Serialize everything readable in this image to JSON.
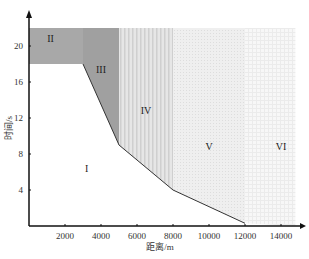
{
  "chart_data": {
    "type": "area",
    "title": "",
    "xlabel": "距离/m",
    "ylabel": "时间/s",
    "xlim": [
      0,
      15500
    ],
    "ylim": [
      0,
      22
    ],
    "x_ticks": [
      2000,
      4000,
      6000,
      8000,
      10000,
      12000,
      14000
    ],
    "y_ticks": [
      4,
      8,
      12,
      16,
      20
    ],
    "grid": false,
    "legend": null,
    "regions": [
      {
        "name": "I",
        "label_pos": [
          3200,
          6
        ],
        "fill": "#ffffff",
        "boundary": [
          [
            0,
            0
          ],
          [
            0,
            18
          ],
          [
            3000,
            18
          ],
          [
            5000,
            9
          ],
          [
            8000,
            4
          ],
          [
            12000,
            0.3
          ]
        ]
      },
      {
        "name": "II",
        "label_pos": [
          1200,
          20.5
        ],
        "fill": "#a8a8a8",
        "polygon": [
          [
            0,
            18
          ],
          [
            0,
            22
          ],
          [
            3000,
            22
          ],
          [
            3000,
            18
          ]
        ]
      },
      {
        "name": "III",
        "label_pos": [
          4000,
          17
        ],
        "fill": "#a0a0a0",
        "polygon": [
          [
            3000,
            18
          ],
          [
            3000,
            22
          ],
          [
            5000,
            22
          ],
          [
            5000,
            9
          ]
        ]
      },
      {
        "name": "IV",
        "label_pos": [
          6500,
          12.5
        ],
        "fill": "#dcdcdc",
        "pattern": "vertical-stripes",
        "polygon": [
          [
            5000,
            9
          ],
          [
            5000,
            22
          ],
          [
            8000,
            22
          ],
          [
            8000,
            4
          ]
        ]
      },
      {
        "name": "V",
        "label_pos": [
          10000,
          8.5
        ],
        "fill": "#ececec",
        "pattern": "dots",
        "polygon": [
          [
            8000,
            4
          ],
          [
            8000,
            22
          ],
          [
            12000,
            22
          ],
          [
            12000,
            0.3
          ]
        ]
      },
      {
        "name": "VI",
        "label_pos": [
          14000,
          8.5
        ],
        "fill": "#f4f4f4",
        "pattern": "grid",
        "polygon": [
          [
            12000,
            0.3
          ],
          [
            12000,
            22
          ],
          [
            14800,
            22
          ],
          [
            14800,
            0
          ]
        ]
      }
    ],
    "boundary_line": {
      "x": [
        3000,
        5000,
        8000,
        12000
      ],
      "y": [
        18,
        9,
        4,
        0.3
      ]
    }
  }
}
